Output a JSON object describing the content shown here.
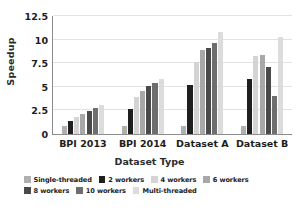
{
  "chart_data": {
    "type": "bar",
    "title": "",
    "xlabel": "Dataset Type",
    "ylabel": "Speedup",
    "categories": [
      "BPI 2013",
      "BPI 2014",
      "Dataset A",
      "Dataset B"
    ],
    "ylim": [
      0,
      12.5
    ],
    "yticks": [
      0,
      2.5,
      5,
      7.5,
      10,
      12.5
    ],
    "ytick_labels": [
      "0",
      "2.5",
      "5",
      "7.5",
      "10",
      "12.5"
    ],
    "grid": true,
    "legend_position": "bottom",
    "series": [
      {
        "name": "Single-threaded",
        "color": "#b0b0b0",
        "values": [
          0.85,
          0.9,
          0.85,
          0.8
        ]
      },
      {
        "name": "2 workers",
        "color": "#1f1f1f",
        "values": [
          1.4,
          2.6,
          5.15,
          5.85
        ]
      },
      {
        "name": "4 workers",
        "color": "#d4d4d4",
        "values": [
          1.85,
          3.9,
          7.6,
          8.3
        ]
      },
      {
        "name": "6 workers",
        "color": "#a8a8a8",
        "values": [
          2.15,
          4.6,
          8.85,
          8.35
        ]
      },
      {
        "name": "8 workers",
        "color": "#4a4a4a",
        "values": [
          2.4,
          5.05,
          9.15,
          7.15
        ]
      },
      {
        "name": "10 workers",
        "color": "#6e6e6e",
        "values": [
          2.75,
          5.45,
          9.6,
          4.0
        ]
      },
      {
        "name": "Multi-threaded",
        "color": "#dcdcdc",
        "values": [
          3.05,
          5.85,
          10.8,
          10.25
        ]
      }
    ]
  },
  "axes": {
    "y_title": "Speedup",
    "x_title": "Dataset Type"
  }
}
